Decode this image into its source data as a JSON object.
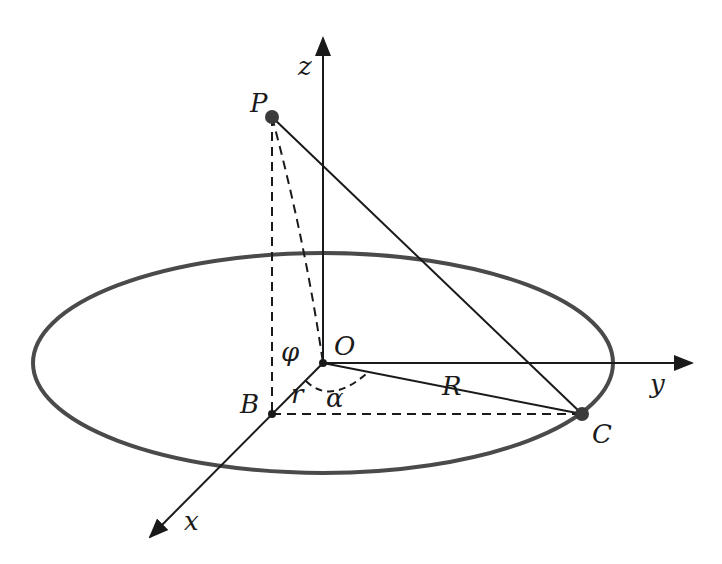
{
  "diagram": {
    "type": "3d-geometry",
    "colors": {
      "line": "#1a1a1a",
      "circle": "#4a4a4a",
      "point": "#3a3a3a"
    },
    "axes": {
      "x": "x",
      "y": "y",
      "z": "z"
    },
    "points": {
      "P": "P",
      "O": "O",
      "B": "B",
      "C": "C"
    },
    "labels": {
      "radius": "R",
      "small_r": "r",
      "angle_alpha": "α",
      "angle_phi": "φ"
    },
    "edges": [
      {
        "from": "P",
        "to": "C",
        "style": "solid"
      },
      {
        "from": "O",
        "to": "C",
        "style": "solid",
        "label": "R"
      },
      {
        "from": "P",
        "to": "B",
        "style": "dashed"
      },
      {
        "from": "P",
        "to": "O",
        "style": "dashed"
      },
      {
        "from": "B",
        "to": "C",
        "style": "dashed"
      },
      {
        "from": "O",
        "to": "B",
        "style": "solid",
        "label": "r"
      }
    ]
  }
}
